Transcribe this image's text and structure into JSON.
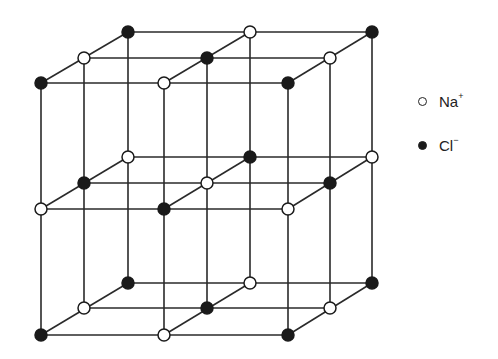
{
  "legend": [
    {
      "symbol": "open-circle",
      "label": "Na",
      "charge": "+",
      "color": "#ffffff"
    },
    {
      "symbol": "filled-circle",
      "label": "Cl",
      "charge": "−",
      "color": "#1a1a1a"
    }
  ],
  "lattice": {
    "columns_x": [
      [
        41,
        164,
        288
      ],
      [
        84,
        207,
        330
      ],
      [
        128,
        250,
        372
      ]
    ],
    "layers_y": [
      [
        83,
        58,
        32
      ],
      [
        209,
        183,
        157
      ],
      [
        335,
        308,
        283
      ]
    ],
    "pattern_note": "alternating Na+ and Cl- at every lattice point, 3x3x3"
  }
}
